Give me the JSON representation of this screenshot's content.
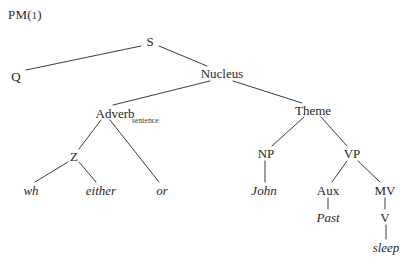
{
  "figure": {
    "label_prefix": "PM",
    "label_open": "(",
    "label_number": "1",
    "label_close": ")",
    "full_label": "PM(1)",
    "ink_color": "#262626",
    "line_color": "#3a3a3a",
    "background_color": "#ffffff",
    "width": 414,
    "height": 271
  },
  "tree": {
    "type": "phrase-structure-tree",
    "root": "S",
    "nodes": [
      {
        "id": "S",
        "label": "S",
        "x": 150,
        "y": 41,
        "kind": "category"
      },
      {
        "id": "Q",
        "label": "Q",
        "x": 16,
        "y": 76,
        "kind": "category"
      },
      {
        "id": "Nucleus",
        "label": "Nucleus",
        "x": 222,
        "y": 73,
        "kind": "category"
      },
      {
        "id": "Adverb",
        "label": "Adverb",
        "x": 115,
        "y": 113,
        "kind": "category",
        "subscript": "sentence"
      },
      {
        "id": "Theme",
        "label": "Theme",
        "x": 313,
        "y": 110,
        "kind": "category"
      },
      {
        "id": "Z",
        "label": "Z",
        "x": 74,
        "y": 156,
        "kind": "category"
      },
      {
        "id": "or",
        "label": "or",
        "x": 162,
        "y": 190,
        "kind": "leaf"
      },
      {
        "id": "wh",
        "label": "wh",
        "x": 31,
        "y": 190,
        "kind": "leaf"
      },
      {
        "id": "either",
        "label": "either",
        "x": 101,
        "y": 190,
        "kind": "leaf"
      },
      {
        "id": "NP",
        "label": "NP",
        "x": 266,
        "y": 153,
        "kind": "category"
      },
      {
        "id": "VP",
        "label": "VP",
        "x": 352,
        "y": 153,
        "kind": "category"
      },
      {
        "id": "John",
        "label": "John",
        "x": 264,
        "y": 190,
        "kind": "leaf"
      },
      {
        "id": "Aux",
        "label": "Aux",
        "x": 328,
        "y": 190,
        "kind": "category"
      },
      {
        "id": "MV",
        "label": "MV",
        "x": 385,
        "y": 190,
        "kind": "category"
      },
      {
        "id": "Past",
        "label": "Past",
        "x": 328,
        "y": 217,
        "kind": "leaf"
      },
      {
        "id": "V",
        "label": "V",
        "x": 385,
        "y": 217,
        "kind": "category"
      },
      {
        "id": "sleep",
        "label": "sleep",
        "x": 386,
        "y": 247,
        "kind": "leaf"
      }
    ],
    "edges": [
      {
        "from": "S",
        "to": "Q",
        "x1": 141,
        "y1": 46,
        "x2": 26,
        "y2": 70
      },
      {
        "from": "S",
        "to": "Nucleus",
        "x1": 159,
        "y1": 46,
        "x2": 207,
        "y2": 66
      },
      {
        "from": "Nucleus",
        "to": "Adverb",
        "x1": 210,
        "y1": 81,
        "x2": 113,
        "y2": 105
      },
      {
        "from": "Nucleus",
        "to": "Theme",
        "x1": 233,
        "y1": 81,
        "x2": 302,
        "y2": 103
      },
      {
        "from": "Adverb",
        "to": "Z",
        "x1": 101,
        "y1": 120,
        "x2": 79,
        "y2": 149
      },
      {
        "from": "Adverb",
        "to": "or",
        "x1": 110,
        "y1": 120,
        "x2": 159,
        "y2": 182
      },
      {
        "from": "Z",
        "to": "wh",
        "x1": 68,
        "y1": 162,
        "x2": 35,
        "y2": 182
      },
      {
        "from": "Z",
        "to": "either",
        "x1": 79,
        "y1": 162,
        "x2": 96,
        "y2": 182
      },
      {
        "from": "Theme",
        "to": "NP",
        "x1": 304,
        "y1": 117,
        "x2": 272,
        "y2": 146
      },
      {
        "from": "Theme",
        "to": "VP",
        "x1": 321,
        "y1": 117,
        "x2": 347,
        "y2": 146
      },
      {
        "from": "NP",
        "to": "John",
        "x1": 265,
        "y1": 161,
        "x2": 265,
        "y2": 182
      },
      {
        "from": "VP",
        "to": "Aux",
        "x1": 347,
        "y1": 161,
        "x2": 332,
        "y2": 182
      },
      {
        "from": "VP",
        "to": "MV",
        "x1": 358,
        "y1": 161,
        "x2": 380,
        "y2": 182
      },
      {
        "from": "Aux",
        "to": "Past",
        "x1": 328,
        "y1": 198,
        "x2": 328,
        "y2": 209
      },
      {
        "from": "MV",
        "to": "V",
        "x1": 385,
        "y1": 198,
        "x2": 385,
        "y2": 209
      },
      {
        "from": "V",
        "to": "sleep",
        "x1": 386,
        "y1": 225,
        "x2": 386,
        "y2": 239
      }
    ]
  }
}
